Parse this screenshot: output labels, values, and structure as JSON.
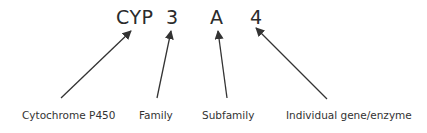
{
  "diagram": {
    "code_parts": [
      {
        "id": "cyp",
        "text": "CYP"
      },
      {
        "id": "family",
        "text": "3"
      },
      {
        "id": "subfamily",
        "text": "A"
      },
      {
        "id": "gene",
        "text": "4"
      }
    ],
    "labels": [
      {
        "id": "cyp",
        "text": "Cytochrome P450"
      },
      {
        "id": "family",
        "text": "Family"
      },
      {
        "id": "subfamily",
        "text": "Subfamily"
      },
      {
        "id": "gene",
        "text": "Individual gene/enzyme"
      }
    ],
    "arrows": [
      {
        "from": "Cytochrome P450",
        "to": "CYP",
        "x1": 61,
        "y1": 98,
        "x2": 131,
        "y2": 31
      },
      {
        "from": "Family",
        "to": "3",
        "x1": 157,
        "y1": 98,
        "x2": 171,
        "y2": 31
      },
      {
        "from": "Subfamily",
        "to": "A",
        "x1": 227,
        "y1": 98,
        "x2": 218,
        "y2": 31
      },
      {
        "from": "Individual gene/enzyme",
        "to": "4",
        "x1": 327,
        "y1": 99,
        "x2": 256,
        "y2": 28
      }
    ],
    "colors": {
      "text": "#2b2b2b",
      "arrow": "#333333",
      "background": "#ffffff"
    }
  }
}
